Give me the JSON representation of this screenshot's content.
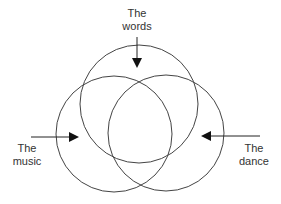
{
  "diagram": {
    "title": "",
    "circles": [
      {
        "id": "words",
        "cx": 139,
        "cy": 104,
        "r": 59
      },
      {
        "id": "music",
        "cx": 114,
        "cy": 134,
        "r": 58
      },
      {
        "id": "dance",
        "cx": 166,
        "cy": 133,
        "r": 58
      }
    ],
    "labels": {
      "words": {
        "line1": "The",
        "line2": "words"
      },
      "music": {
        "line1": "The",
        "line2": "music"
      },
      "dance": {
        "line1": "The",
        "line2": "dance"
      }
    },
    "colors": {
      "stroke": "#444444",
      "text": "#333333",
      "background": "#ffffff"
    }
  }
}
